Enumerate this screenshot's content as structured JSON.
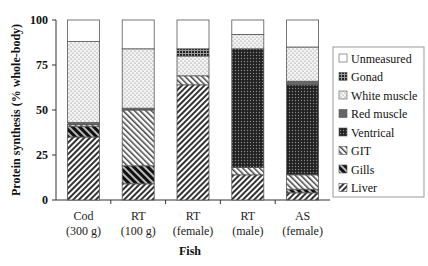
{
  "chart_data": {
    "type": "bar",
    "stacked": true,
    "title": "",
    "xlabel": "Fish",
    "ylabel": "Protein synthesis (% whole-body)",
    "ylim": [
      0,
      100
    ],
    "yticks": [
      "0",
      "25",
      "50",
      "75",
      "100"
    ],
    "categories": [
      [
        "Cod",
        "(300 g)"
      ],
      [
        "RT",
        "(100 g)"
      ],
      [
        "RT",
        "(female)"
      ],
      [
        "RT",
        "(male)"
      ],
      [
        "AS",
        "(female)"
      ]
    ],
    "legend_position": "right",
    "series": [
      {
        "name": "Liver",
        "pattern": "diag-fine",
        "values": [
          35,
          9,
          64,
          14,
          4
        ]
      },
      {
        "name": "Gills",
        "pattern": "diag-dark",
        "values": [
          6,
          10,
          0,
          0,
          2
        ]
      },
      {
        "name": "GIT",
        "pattern": "diag-back",
        "values": [
          1,
          31,
          5,
          4,
          8
        ]
      },
      {
        "name": "Ventrical",
        "pattern": "dots-dark",
        "values": [
          0,
          0,
          0,
          66,
          50
        ]
      },
      {
        "name": "Red muscle",
        "pattern": "grey",
        "values": [
          1,
          1,
          0,
          0,
          2
        ]
      },
      {
        "name": "White muscle",
        "pattern": "dots-light",
        "values": [
          45,
          33,
          11,
          8,
          19
        ]
      },
      {
        "name": "Gonad",
        "pattern": "grid-dark",
        "values": [
          0,
          0,
          4,
          0,
          0
        ]
      },
      {
        "name": "Unmeasured",
        "pattern": "blank",
        "values": [
          12,
          16,
          16,
          8,
          15
        ]
      }
    ],
    "legend": [
      "Unmeasured",
      "Gonad",
      "White muscle",
      "Red muscle",
      "Ventrical",
      "GIT",
      "Gills",
      "Liver"
    ]
  }
}
